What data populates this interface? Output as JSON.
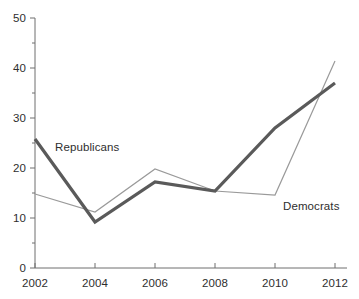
{
  "chart_data": {
    "type": "line",
    "title": "",
    "subtitle": "",
    "xlabel": "",
    "ylabel": "",
    "x": [
      2002,
      2004,
      2006,
      2008,
      2010,
      2012
    ],
    "xtick_labels": [
      "2002",
      "2004",
      "2006",
      "2008",
      "2010",
      "2012"
    ],
    "ytick_labels": [
      "0",
      "10",
      "20",
      "30",
      "40",
      "50"
    ],
    "ytick_values": [
      0,
      10,
      20,
      30,
      40,
      50
    ],
    "ylim": [
      0,
      50
    ],
    "xlim": [
      2002,
      2012
    ],
    "grid": false,
    "legend_position": "inline-annotations",
    "series": [
      {
        "name": "Republicans",
        "values": [
          25.8,
          9.2,
          17.2,
          15.4,
          28.0,
          37.0
        ],
        "color": "#5a5a5a",
        "line_width": 3.2,
        "annotation": {
          "label": "Republicans",
          "x_px": 55,
          "y_px": 141
        }
      },
      {
        "name": "Democrats",
        "values": [
          14.8,
          11.2,
          19.8,
          15.4,
          14.6,
          41.4
        ],
        "color": "#9a9a9a",
        "line_width": 1.2,
        "annotation": {
          "label": "Democrats",
          "x_px": 283,
          "y_px": 200
        }
      }
    ],
    "axis_color": "#6f6f6f",
    "background_color": "#ffffff",
    "text_color": "#2e2e2e"
  },
  "geometry": {
    "plot_left_px": 35,
    "plot_right_px": 335,
    "plot_bottom_px": 268,
    "plot_top_px": 18,
    "x_step_px": 60,
    "px_per_unit_y": 5
  }
}
